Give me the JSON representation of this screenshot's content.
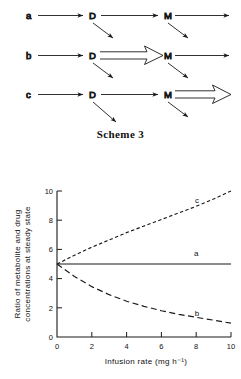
{
  "scheme": {
    "caption": "Scheme 3",
    "rows": [
      {
        "id": "a",
        "start_label": "a",
        "node1": "D",
        "node2": "M",
        "bold_segment": "none"
      },
      {
        "id": "b",
        "start_label": "b",
        "node1": "D",
        "node2": "M",
        "bold_segment": "d-to-m"
      },
      {
        "id": "c",
        "start_label": "c",
        "node1": "D",
        "node2": "M",
        "bold_segment": "m-out"
      }
    ]
  },
  "chart_data": {
    "type": "line",
    "title": "",
    "xlabel": "Infusion rate (mg h⁻¹)",
    "ylabel_line1": "Ratio of metabolite and drug",
    "ylabel_line2": "concentrations at steady state",
    "xlim": [
      0,
      10
    ],
    "ylim": [
      0,
      10
    ],
    "xticks": [
      0,
      2,
      4,
      6,
      8,
      10
    ],
    "xticklabels": [
      "0",
      "2",
      "4",
      "6",
      "8",
      "10"
    ],
    "yticks": [
      0,
      2,
      4,
      6,
      8,
      10
    ],
    "yticklabels": [
      "0",
      "2",
      "4",
      "6",
      "8",
      "10"
    ],
    "grid": false,
    "legend_position": "inline-curve-labels",
    "x": [
      0,
      1,
      2,
      3,
      4,
      5,
      6,
      7,
      8,
      9,
      10
    ],
    "series": [
      {
        "name": "a",
        "label": "a",
        "style": "solid",
        "label_x": 8.0,
        "label_y": 5.55,
        "values": [
          5,
          5,
          5,
          5,
          5,
          5,
          5,
          5,
          5,
          5,
          5
        ]
      },
      {
        "name": "c",
        "label": "c",
        "style": "dashed-short",
        "label_x": 8.05,
        "label_y": 9.2,
        "values": [
          5,
          5.6,
          6.15,
          6.65,
          7.15,
          7.6,
          8.05,
          8.5,
          8.95,
          9.45,
          10
        ]
      },
      {
        "name": "b",
        "label": "b",
        "style": "dashed-long",
        "label_x": 8.05,
        "label_y": 1.45,
        "values": [
          5,
          4.15,
          3.45,
          2.9,
          2.45,
          2.1,
          1.8,
          1.55,
          1.35,
          1.15,
          0.95
        ]
      }
    ]
  }
}
